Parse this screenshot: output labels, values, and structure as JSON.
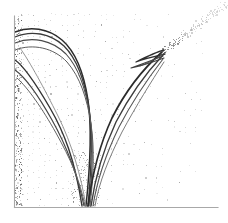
{
  "figure": {
    "kind": "caustic-trajectory-plot",
    "width": 228,
    "height": 223,
    "background_color": "#ffffff"
  },
  "colors": {
    "background": "#ffffff",
    "axis": "#a8a8a8",
    "curve_dark": "#2b2b2b",
    "curve_mid": "#555555",
    "curve_light": "#7d7d7d",
    "stipple": "#c9c9c9",
    "stipple_dark": "#9a9a9a",
    "trail_dot": "#b5b5b5"
  },
  "axes": {
    "left_axis": {
      "x": 14.5,
      "y_top": 16,
      "y_bottom": 207.5,
      "stroke_width": 1.1
    },
    "bottom_axis": {
      "y": 207.5,
      "x_left": 14.5,
      "x_right": 218,
      "stroke_width": 1.1
    },
    "frame_top": false,
    "frame_right": false,
    "tick_labels": [],
    "xlabel": "",
    "ylabel": "",
    "title": ""
  },
  "chart_data": {
    "type": "line",
    "title": "",
    "subtitle": "",
    "xlabel": "",
    "ylabel": "",
    "xlim": [
      0,
      228
    ],
    "ylim": [
      223,
      0
    ],
    "grid": false,
    "legend": null,
    "legend_position": "none",
    "annotations": [
      {
        "name": "left-loop-bundle",
        "note": "Dense bundle of curves arcing from the left axis near y=30-95, looping right and descending",
        "x": 30,
        "y": 55
      },
      {
        "name": "v-convergence",
        "note": "Curves converge into a narrow V and terminate at the bottom axis near x=80-95",
        "x": 86,
        "y": 205
      },
      {
        "name": "cusp-point",
        "note": "Swallowtail cusp / arrowhead where the right branch folds back on itself",
        "x": 160,
        "y": 53
      },
      {
        "name": "dotted-trail",
        "note": "Faint dotted diagonal trail continuing from the cusp to the upper-right corner",
        "x": 200,
        "y": 20
      }
    ],
    "series": [
      {
        "name": "caustic-left-arc-1",
        "stroke": "#2b2b2b",
        "width": 1.5,
        "path": "M 15,32 C 30,26 48,28 62,40 C 76,52 84,74 88,100 C 92,128 90,168 86,206"
      },
      {
        "name": "caustic-left-arc-2",
        "stroke": "#3a3a3a",
        "width": 1.3,
        "path": "M 15,37 C 31,30 50,33 64,46 C 78,60 85,82 89,108 C 93,136 91,174 88,206"
      },
      {
        "name": "caustic-left-arc-3",
        "stroke": "#4a4a4a",
        "width": 1.1,
        "path": "M 15,43 C 32,36 52,40 66,54 C 79,68 86,90 90,116 C 94,144 92,178 89,206"
      },
      {
        "name": "caustic-left-arc-4",
        "stroke": "#5c5c5c",
        "width": 1.0,
        "path": "M 15,50 C 33,43 54,48 67,62 C 80,77 87,98 91,124 C 95,150 93,180 90,206"
      },
      {
        "name": "caustic-left-steep-1",
        "stroke": "#343434",
        "width": 1.4,
        "path": "M 15,60 C 24,66 36,84 50,108 C 64,132 75,160 82,206"
      },
      {
        "name": "caustic-left-steep-2",
        "stroke": "#454545",
        "width": 1.2,
        "path": "M 15,70 C 25,77 38,95 52,120 C 66,145 77,172 84,206"
      },
      {
        "name": "caustic-left-steep-3",
        "stroke": "#636363",
        "width": 1.0,
        "path": "M 17,78 C 28,88 42,108 56,133 C 70,158 80,180 85,206"
      },
      {
        "name": "caustic-left-faint",
        "stroke": "#8a8a8a",
        "width": 0.9,
        "path": "M 20,48 C 30,62 44,88 58,116 C 72,144 81,176 86,206"
      },
      {
        "name": "caustic-right-branch-1",
        "stroke": "#2b2b2b",
        "width": 1.7,
        "path": "M 88,206 C 92,176 99,146 112,118 C 126,90 144,68 162,52"
      },
      {
        "name": "caustic-right-branch-2",
        "stroke": "#3c3c3c",
        "width": 1.4,
        "path": "M 91,206 C 95,178 103,150 116,122 C 130,95 147,72 163,55"
      },
      {
        "name": "caustic-right-branch-3",
        "stroke": "#555555",
        "width": 1.1,
        "path": "M 93,206 C 97,180 106,154 119,127 C 133,100 149,77 163,59"
      },
      {
        "name": "caustic-right-branch-4",
        "stroke": "#6e6e6e",
        "width": 0.9,
        "path": "M 95,206 C 99,182 109,158 122,132 C 136,106 151,82 164,62"
      },
      {
        "name": "cusp-fold-upper",
        "stroke": "#2f2f2f",
        "width": 1.3,
        "path": "M 164,50 C 156,52 146,57 136,62 C 146,58 156,56 165,54"
      },
      {
        "name": "cusp-fold-lower",
        "stroke": "#3f3f3f",
        "width": 1.1,
        "path": "M 163,56 C 153,60 142,64 131,68 C 142,66 153,62 164,58"
      },
      {
        "name": "cusp-tail",
        "stroke": "#4a4a4a",
        "width": 1.0,
        "path": "M 140,66 C 150,62 158,58 166,52"
      }
    ]
  }
}
